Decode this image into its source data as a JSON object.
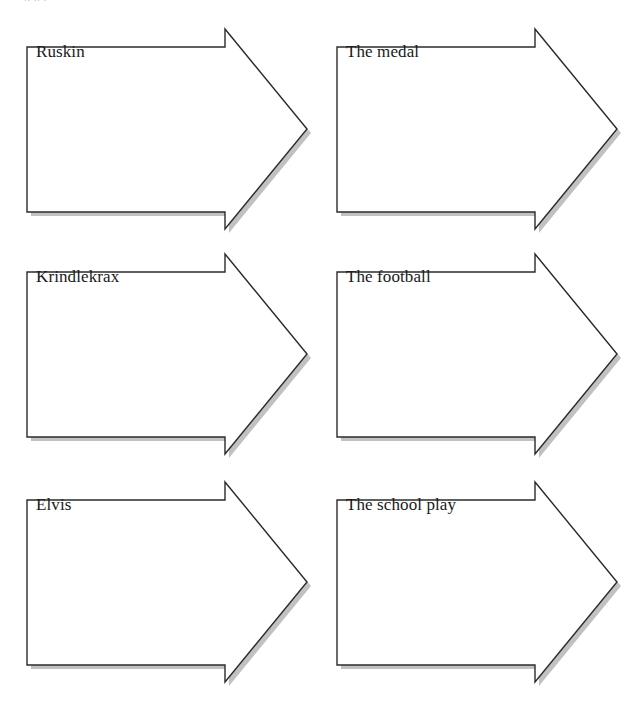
{
  "document": {
    "title": "Arrow sequence worksheet",
    "background_color": "#ffffff",
    "clipped_heading": "    ..            ..  .",
    "arrow": {
      "outline_color": "#2b2b2b",
      "fill_color": "#ffffff",
      "shadow_color": "#9b9b9b",
      "icon_name": "block-arrow-right"
    }
  },
  "arrows": [
    {
      "id": "arrow-1",
      "label": "Ruskin",
      "column": 0,
      "row": 0
    },
    {
      "id": "arrow-2",
      "label": "The medal",
      "column": 1,
      "row": 0
    },
    {
      "id": "arrow-3",
      "label": "Krindlekrax",
      "column": 0,
      "row": 1
    },
    {
      "id": "arrow-4",
      "label": "The football",
      "column": 1,
      "row": 1
    },
    {
      "id": "arrow-5",
      "label": "Elvis",
      "column": 0,
      "row": 2
    },
    {
      "id": "arrow-6",
      "label": "The school play",
      "column": 1,
      "row": 2
    }
  ]
}
